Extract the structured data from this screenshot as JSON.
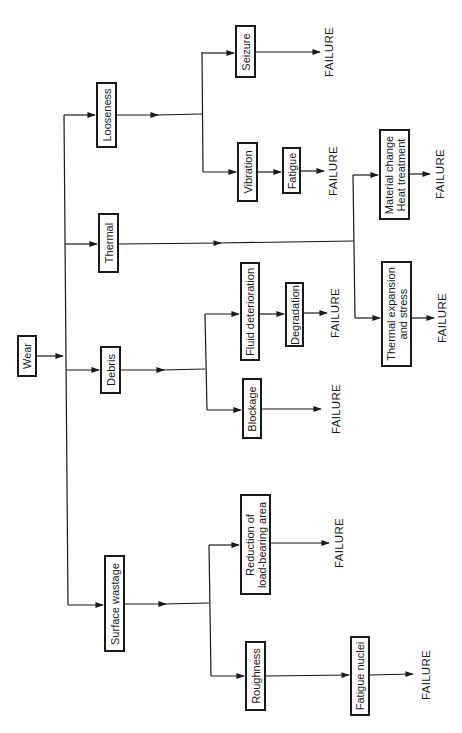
{
  "diagram": {
    "orientation": "rotated-90-ccw",
    "root": {
      "label": "Wear"
    },
    "failure_label": "FAILURE",
    "nodes": {
      "wear": "Wear",
      "looseness": "Looseness",
      "thermal": "Thermal",
      "debris": "Debris",
      "surface_wastage": "Surface wastage",
      "seizure": "Seizure",
      "vibration": "Vibration",
      "fatigue": "Fatigue",
      "material_change_1": "Material change",
      "material_change_2": "Heat treatment",
      "thermal_expansion_1": "Thermal expansion",
      "thermal_expansion_2": "and stress",
      "fluid_deterioration": "Fluid deterioration",
      "degradation": "Degradation",
      "blockage": "Blockage",
      "reduction_1": "Reduction of",
      "reduction_2": "load-bearing area",
      "roughness": "Roughness",
      "fatigue_nuclei": "Fatigue nuclei"
    },
    "edges": [
      [
        "Wear",
        "Looseness"
      ],
      [
        "Wear",
        "Thermal"
      ],
      [
        "Wear",
        "Debris"
      ],
      [
        "Wear",
        "Surface wastage"
      ],
      [
        "Looseness",
        "Seizure"
      ],
      [
        "Looseness",
        "Vibration"
      ],
      [
        "Seizure",
        "FAILURE"
      ],
      [
        "Vibration",
        "Fatigue"
      ],
      [
        "Fatigue",
        "FAILURE"
      ],
      [
        "Thermal",
        "Material change / Heat treatment"
      ],
      [
        "Thermal",
        "Thermal expansion and stress"
      ],
      [
        "Material change / Heat treatment",
        "FAILURE"
      ],
      [
        "Thermal expansion and stress",
        "FAILURE"
      ],
      [
        "Debris",
        "Fluid deterioration"
      ],
      [
        "Debris",
        "Blockage"
      ],
      [
        "Fluid deterioration",
        "Degradation"
      ],
      [
        "Degradation",
        "FAILURE"
      ],
      [
        "Blockage",
        "FAILURE"
      ],
      [
        "Surface wastage",
        "Reduction of load-bearing area"
      ],
      [
        "Surface wastage",
        "Roughness"
      ],
      [
        "Reduction of load-bearing area",
        "FAILURE"
      ],
      [
        "Roughness",
        "Fatigue nuclei"
      ],
      [
        "Fatigue nuclei",
        "FAILURE"
      ]
    ]
  }
}
